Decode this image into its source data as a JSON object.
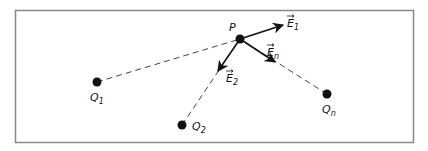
{
  "diagram": {
    "frame": {
      "x": 15,
      "y": 10,
      "width": 398,
      "height": 132,
      "color": "#888888"
    },
    "point_P": {
      "label": "P",
      "x": 240,
      "y": 39
    },
    "charges": [
      {
        "label": "Q",
        "sub": "1",
        "x": 97,
        "y": 82,
        "label_x": 90,
        "label_y": 101
      },
      {
        "label": "Q",
        "sub": "2",
        "x": 182,
        "y": 125,
        "label_x": 192,
        "label_y": 130
      },
      {
        "label": "Q",
        "sub": "n",
        "x": 327,
        "y": 94,
        "label_x": 322,
        "label_y": 113
      }
    ],
    "fields": [
      {
        "label": "E",
        "sub": "1",
        "to_x": 283,
        "to_y": 25,
        "label_x": 286,
        "label_y": 27
      },
      {
        "label": "E",
        "sub": "2",
        "to_x": 218,
        "to_y": 71,
        "label_x": 226,
        "label_y": 81
      },
      {
        "label": "E",
        "sub": "n",
        "to_x": 275,
        "to_y": 62,
        "label_x": 266,
        "label_y": 55
      }
    ],
    "colors": {
      "ink": "#111111",
      "frame": "#888888",
      "dash": "#444444"
    }
  }
}
